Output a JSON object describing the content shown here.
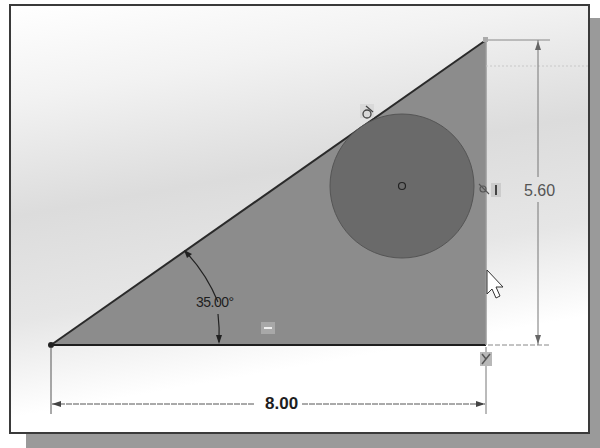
{
  "window": {
    "type": "CAD sketch viewport"
  },
  "sketch": {
    "triangle": {
      "vertices": [
        [
          49,
          343
        ],
        [
          484,
          38
        ],
        [
          484,
          343
        ]
      ],
      "fill": "#8c8c8c",
      "edge_color": "#2a2a2a"
    },
    "circle": {
      "cx": 400,
      "cy": 184,
      "r": 72,
      "fill": "#6a6a6a",
      "center_marker": "origin-point"
    },
    "dimensions": {
      "horizontal": {
        "value": "8.00"
      },
      "vertical": {
        "value": "5.60"
      },
      "angle": {
        "value": "35.00°"
      }
    },
    "relations": [
      {
        "name": "tangent-relation",
        "glyph": "ძ",
        "x": 366,
        "y": 110
      },
      {
        "name": "tangent-relation-2",
        "glyph": "ძI",
        "x": 480,
        "y": 186
      },
      {
        "name": "horizontal-relation",
        "glyph": "—",
        "x": 266,
        "y": 327
      },
      {
        "name": "coincident-relation",
        "glyph": "✕",
        "x": 484,
        "y": 356
      }
    ],
    "colors": {
      "dimension_line": "#555555",
      "shadow": "#9a9a9a",
      "border": "#3a3a3a"
    }
  },
  "cursor": {
    "type": "arrow-pointer",
    "x": 486,
    "y": 270
  }
}
